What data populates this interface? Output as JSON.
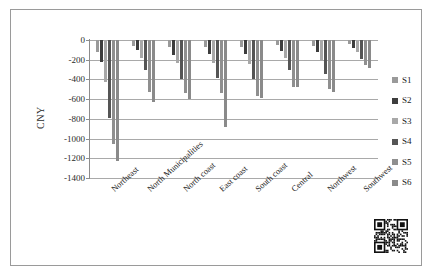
{
  "chart_data": {
    "type": "bar",
    "title": "",
    "xlabel": "",
    "ylabel": "CNY",
    "ylim": [
      -1400,
      0
    ],
    "yticks": [
      0,
      -200,
      -400,
      -600,
      -800,
      -1000,
      -1200,
      -1400
    ],
    "ytick_labels": [
      "0",
      "-200",
      "-400",
      "-600",
      "-800",
      "-1000",
      "-1200",
      "-1400"
    ],
    "grid": true,
    "legend_position": "right",
    "orientation": "vertical",
    "categories": [
      "Northeast",
      "North Municipalities",
      "North coast",
      "East coast",
      "South coast",
      "Central",
      "Northwest",
      "Southwest"
    ],
    "series": [
      {
        "name": "S1",
        "color": "#9a9a9a",
        "values": [
          -120,
          -60,
          -70,
          -75,
          -70,
          -55,
          -60,
          -45
        ]
      },
      {
        "name": "S2",
        "color": "#3d3d3d",
        "values": [
          -225,
          -105,
          -150,
          -145,
          -145,
          -110,
          -125,
          -80
        ]
      },
      {
        "name": "S3",
        "color": "#a8a8a8",
        "values": [
          -430,
          -185,
          -235,
          -230,
          -240,
          -185,
          -215,
          -125
        ]
      },
      {
        "name": "S4",
        "color": "#555555",
        "values": [
          -795,
          -300,
          -395,
          -385,
          -400,
          -300,
          -340,
          -195
        ]
      },
      {
        "name": "S5",
        "color": "#8f8f8f",
        "values": [
          -1060,
          -525,
          -540,
          -540,
          -570,
          -480,
          -500,
          -250
        ]
      },
      {
        "name": "S6",
        "color": "#8a8a8a",
        "values": [
          -1225,
          -630,
          -595,
          -880,
          -585,
          -480,
          -525,
          -285
        ]
      }
    ]
  },
  "legend": {
    "items": [
      {
        "label": "S1"
      },
      {
        "label": "S2"
      },
      {
        "label": "S3"
      },
      {
        "label": "S4"
      },
      {
        "label": "S5"
      },
      {
        "label": "S6"
      }
    ]
  },
  "qr_code": {
    "present": true,
    "alt": "qr-code"
  }
}
